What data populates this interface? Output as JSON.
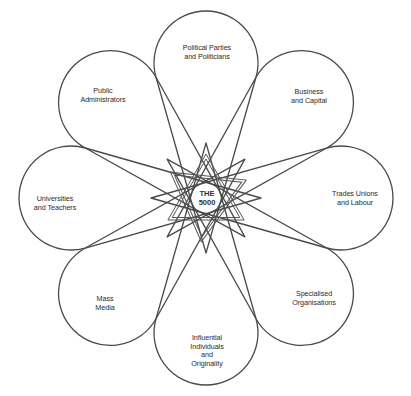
{
  "diagram": {
    "center": {
      "lines": [
        "THE",
        "5000"
      ]
    },
    "petals": [
      {
        "id": "political-parties",
        "lines": [
          "Political Parties",
          "and Politicians"
        ]
      },
      {
        "id": "business-capital",
        "lines": [
          "Business",
          "and Capital"
        ]
      },
      {
        "id": "trades-unions",
        "lines": [
          "Trades Unions",
          "and Labour"
        ]
      },
      {
        "id": "specialised-organisations",
        "lines": [
          "Specialised",
          "Organisations"
        ]
      },
      {
        "id": "influential-individuals",
        "lines": [
          "Influential",
          "Individuals",
          "and",
          "Originality"
        ]
      },
      {
        "id": "mass-media",
        "lines": [
          "Mass",
          "Media"
        ]
      },
      {
        "id": "universities-teachers",
        "lines": [
          "Universities",
          "and Teachers"
        ]
      },
      {
        "id": "public-administrators",
        "lines": [
          "Public",
          "Administrators"
        ]
      }
    ]
  },
  "colors": {
    "background": "#ffffff",
    "stroke": "#4a4a4a",
    "text": "#2b2b2b"
  }
}
